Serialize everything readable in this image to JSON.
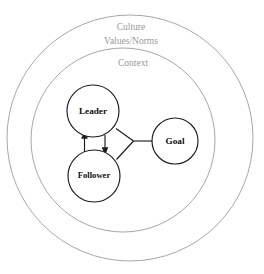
{
  "diagram": {
    "background_color": "#ffffff",
    "ring_stroke_color": "#a8a8a8",
    "node_stroke_color": "#1c1c1c",
    "ring_label_color": "#9a9a9a",
    "node_label_color": "#0d0d0d",
    "rings": [
      {
        "id": "culture",
        "label_line_1": "Culture",
        "label_line_2": "Values/Norms",
        "cx": 130,
        "cy": 138,
        "r": 123
      },
      {
        "id": "context",
        "label_line_1": "Context",
        "label_line_2": "",
        "cx": 123,
        "cy": 140,
        "r": 92
      }
    ],
    "nodes": [
      {
        "id": "leader",
        "label": "Leader",
        "cx": 93,
        "cy": 111,
        "r": 26
      },
      {
        "id": "follower",
        "label": "Follower",
        "cx": 94,
        "cy": 176,
        "r": 26
      },
      {
        "id": "goal",
        "label": "Goal",
        "cx": 175,
        "cy": 141,
        "r": 23
      }
    ],
    "connections": [
      {
        "id": "leader-to-follower",
        "from": "leader",
        "to": "follower",
        "arrow": "down"
      },
      {
        "id": "follower-to-leader",
        "from": "follower",
        "to": "leader",
        "arrow": "up"
      },
      {
        "id": "leader-to-junction",
        "from": "leader",
        "to": "junction",
        "arrow": "none"
      },
      {
        "id": "follower-to-junction",
        "from": "follower",
        "to": "junction",
        "arrow": "none"
      },
      {
        "id": "junction-to-goal",
        "from": "junction",
        "to": "goal",
        "arrow": "none"
      }
    ]
  }
}
